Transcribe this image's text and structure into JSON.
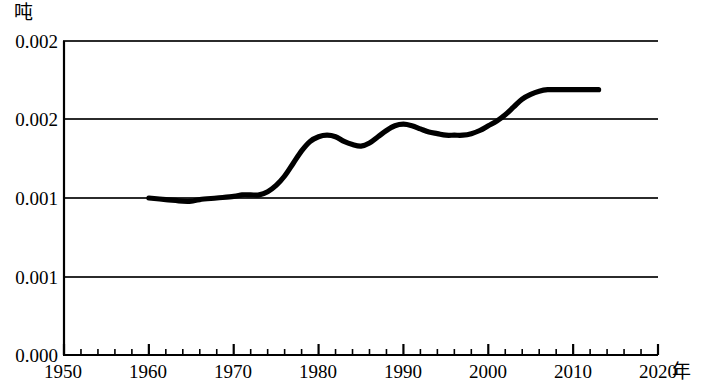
{
  "chart_data": {
    "type": "line",
    "title": "",
    "subtitle": "",
    "ylabel": "吨",
    "xlabel": "年",
    "grid": true,
    "legend": null,
    "xlim": [
      1950,
      2020
    ],
    "ylim": [
      0.0,
      0.002
    ],
    "x_ticks": [
      1950,
      1960,
      1970,
      1980,
      1990,
      2000,
      2010,
      2020
    ],
    "x_tick_labels": [
      "1950",
      "1960",
      "1970",
      "1980",
      "1990",
      "2000",
      "2010",
      "2020"
    ],
    "x_minor_tick_step": 2,
    "y_ticks": [
      0.0,
      0.001,
      0.001,
      0.002,
      0.002
    ],
    "y_tick_labels": [
      "0.000",
      "0.001",
      "0.001",
      "0.002",
      "0.002"
    ],
    "series": [
      {
        "name": "",
        "color": "#000000",
        "x": [
          1960,
          1962,
          1964,
          1965,
          1966,
          1968,
          1970,
          1971,
          1972,
          1973,
          1974,
          1975,
          1976,
          1977,
          1978,
          1979,
          1980,
          1981,
          1982,
          1983,
          1984,
          1985,
          1986,
          1987,
          1988,
          1989,
          1990,
          1991,
          1992,
          1993,
          1994,
          1995,
          1996,
          1997,
          1998,
          1999,
          2000,
          2001,
          2002,
          2003,
          2004,
          2005,
          2006,
          2007,
          2008,
          2009,
          2010,
          2011,
          2012,
          2013
        ],
        "y": [
          0.001,
          0.00099,
          0.00098,
          0.00098,
          0.00099,
          0.001,
          0.00101,
          0.00102,
          0.00102,
          0.00102,
          0.00104,
          0.00108,
          0.00114,
          0.00122,
          0.0013,
          0.00136,
          0.00139,
          0.0014,
          0.00139,
          0.00136,
          0.00134,
          0.00133,
          0.00135,
          0.00139,
          0.00143,
          0.00146,
          0.00147,
          0.00146,
          0.00144,
          0.00142,
          0.00141,
          0.0014,
          0.0014,
          0.0014,
          0.00141,
          0.00143,
          0.00146,
          0.00149,
          0.00153,
          0.00158,
          0.00163,
          0.00166,
          0.00168,
          0.00169,
          0.00169,
          0.00169,
          0.00169,
          0.00169,
          0.00169,
          0.00169
        ]
      }
    ],
    "annotations": []
  },
  "axis": {
    "unit_label": "吨",
    "x_title": "年",
    "y_tick_labels": [
      "0.002",
      "0.002",
      "0.001",
      "0.001",
      "0.000"
    ],
    "x_tick_labels": [
      "1950",
      "1960",
      "1970",
      "1980",
      "1990",
      "2000",
      "2010",
      "2020"
    ]
  },
  "style": {
    "line_color": "#000000",
    "grid_color": "#333333",
    "axis_color": "#000000",
    "background": "#ffffff"
  }
}
